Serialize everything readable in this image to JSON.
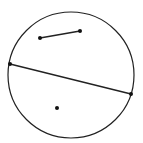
{
  "diagram": {
    "circle": {
      "cx": 71,
      "cy": 75,
      "r": 63,
      "stroke": "#222222"
    },
    "segments": [
      {
        "name": "short-segment",
        "x1": 40,
        "y1": 38,
        "x2": 80,
        "y2": 31
      },
      {
        "name": "chord",
        "x1": 10,
        "y1": 64,
        "x2": 131,
        "y2": 94
      }
    ],
    "points": [
      {
        "name": "segment-endpoint-a",
        "x": 40,
        "y": 38
      },
      {
        "name": "segment-endpoint-b",
        "x": 80,
        "y": 31
      },
      {
        "name": "chord-endpoint-left",
        "x": 10,
        "y": 64
      },
      {
        "name": "chord-endpoint-right",
        "x": 131,
        "y": 94
      },
      {
        "name": "interior-point",
        "x": 57,
        "y": 108
      }
    ]
  }
}
